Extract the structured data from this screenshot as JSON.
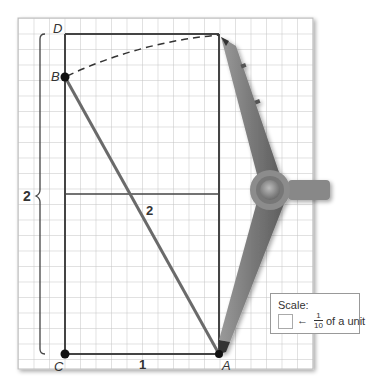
{
  "diagram": {
    "points": [
      {
        "name": "D",
        "x": 65,
        "y": 34
      },
      {
        "name": "B",
        "x": 65,
        "y": 77
      },
      {
        "name": "C",
        "x": 65,
        "y": 354
      },
      {
        "name": "A",
        "x": 219,
        "y": 354
      }
    ],
    "labels": {
      "D": "D",
      "B": "B",
      "C": "C",
      "A": "A",
      "side_height": "2",
      "hypotenuse": "2",
      "base": "1"
    },
    "scale": {
      "title": "Scale:",
      "arrow": "←",
      "numerator": "1",
      "denominator": "10",
      "unit_text": "of a unit"
    },
    "colors": {
      "grid": "#bdbdbd",
      "lines": "#444444",
      "segment_ab": "#666666",
      "compass": "#8a8a8a"
    }
  }
}
